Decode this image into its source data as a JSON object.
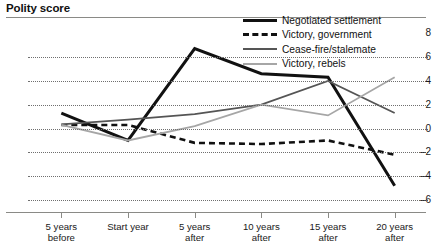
{
  "chart": {
    "title": "Polity score",
    "y_axis": {
      "label": "",
      "ticks": [
        8,
        6,
        4,
        2,
        0,
        -2,
        -4,
        -6
      ],
      "tick_labels": [
        "8",
        "6",
        "4",
        "2",
        "0",
        "–2",
        "–4",
        "–6"
      ],
      "min": -7,
      "max": 8.6
    },
    "x_axis": {
      "label": "",
      "tick_labels": [
        {
          "line1": "5 years",
          "line2": "before"
        },
        {
          "line1": "Start year",
          "line2": ""
        },
        {
          "line1": "5 years",
          "line2": "after"
        },
        {
          "line1": "10 years",
          "line2": "after"
        },
        {
          "line1": "15 years",
          "line2": "after"
        },
        {
          "line1": "20 years",
          "line2": "after"
        }
      ]
    },
    "legend": [
      {
        "label": "Negotiated settlement",
        "style": "solid-thick",
        "color": "#111111"
      },
      {
        "label": "Victory, government",
        "style": "dashed",
        "color": "#111111"
      },
      {
        "label": "Cease-fire/stalemate",
        "style": "solid",
        "color": "#555555"
      },
      {
        "label": "Victory, rebels",
        "style": "solid",
        "color": "#a6a6a6"
      }
    ]
  },
  "chart_data": {
    "type": "line",
    "title": "Polity score",
    "xlabel": "",
    "ylabel": "Polity score",
    "categories": [
      "5 years before",
      "Start year",
      "5 years after",
      "10 years after",
      "15 years after",
      "20 years after"
    ],
    "x": [
      -5,
      0,
      5,
      10,
      15,
      20
    ],
    "ylim": [
      -7,
      8.6
    ],
    "xlim": [
      -7.5,
      22.5
    ],
    "grid": "horizontal-dotted",
    "legend_position": "top-right",
    "series": [
      {
        "name": "Negotiated settlement",
        "color": "#111111",
        "style": "solid-thick",
        "values": [
          1.3,
          -1.0,
          6.7,
          4.6,
          4.3,
          -4.8
        ]
      },
      {
        "name": "Victory, government",
        "color": "#111111",
        "style": "dashed",
        "values": [
          0.3,
          0.3,
          -1.2,
          -1.3,
          -1.0,
          -2.2
        ]
      },
      {
        "name": "Cease-fire/stalemate",
        "color": "#555555",
        "style": "solid",
        "values": [
          0.35,
          0.75,
          1.2,
          2.0,
          4.0,
          1.3
        ]
      },
      {
        "name": "Victory, rebels",
        "color": "#a6a6a6",
        "style": "solid",
        "values": [
          0.3,
          -1.0,
          0.2,
          2.0,
          1.1,
          4.3
        ]
      }
    ]
  }
}
